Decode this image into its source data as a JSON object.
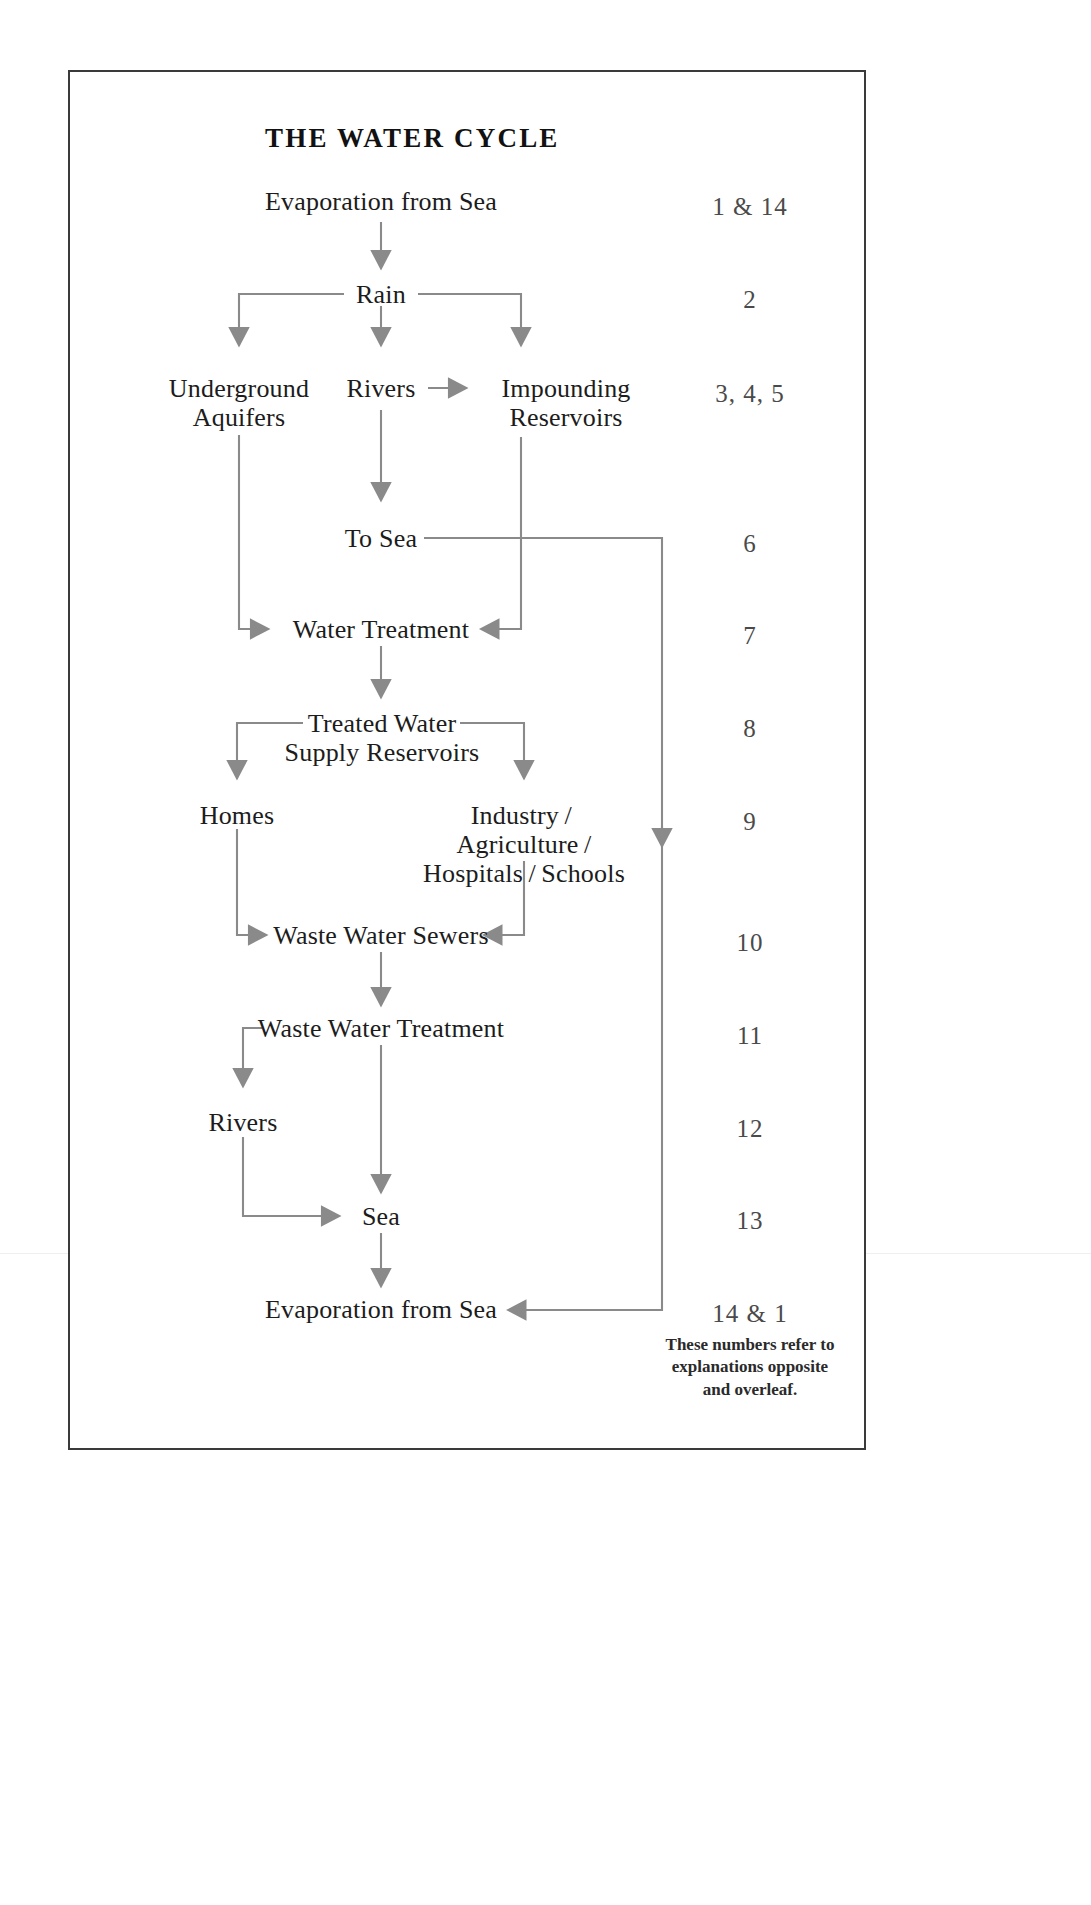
{
  "diagram": {
    "title": "THE WATER CYCLE",
    "footnote": "These numbers refer to explanations opposite and overleaf.",
    "nodes": {
      "evaporation_top": "Evaporation from Sea",
      "rain": "Rain",
      "underground_aquifers_l1": "Underground",
      "underground_aquifers_l2": "Aquifers",
      "rivers_upper": "Rivers",
      "impounding_reservoirs_l1": "Impounding",
      "impounding_reservoirs_l2": "Reservoirs",
      "to_sea": "To Sea",
      "water_treatment": "Water Treatment",
      "treated_water_l1": "Treated Water",
      "treated_water_l2": "Supply Reservoirs",
      "homes": "Homes",
      "industry_l1": "Industry / Agriculture /",
      "industry_l2": "Hospitals / Schools",
      "waste_water_sewers": "Waste Water Sewers",
      "waste_water_treatment": "Waste Water Treatment",
      "rivers_lower": "Rivers",
      "sea": "Sea",
      "evaporation_bottom": "Evaporation from Sea"
    },
    "numbers": [
      {
        "key": "n1",
        "label": "1 & 14"
      },
      {
        "key": "n2",
        "label": "2"
      },
      {
        "key": "n3",
        "label": "3, 4, 5"
      },
      {
        "key": "n4",
        "label": "6"
      },
      {
        "key": "n5",
        "label": "7"
      },
      {
        "key": "n6",
        "label": "8"
      },
      {
        "key": "n7",
        "label": "9"
      },
      {
        "key": "n8",
        "label": "10"
      },
      {
        "key": "n9",
        "label": "11"
      },
      {
        "key": "n10",
        "label": "12"
      },
      {
        "key": "n11",
        "label": "13"
      },
      {
        "key": "n12",
        "label": "14 & 1"
      }
    ],
    "colors": {
      "line": "#8a8a8a",
      "arrow": "#8a8a8a",
      "text": "#1c1c1c",
      "number": "#4a4a4a",
      "frame": "#3a3a3a",
      "background": "#ffffff"
    },
    "flow_edges": [
      {
        "from": "Evaporation from Sea",
        "to": "Rain",
        "type": "down-arrow"
      },
      {
        "from": "Rain",
        "to": "Underground Aquifers",
        "type": "branch-left-down-arrow"
      },
      {
        "from": "Rain",
        "to": "Rivers",
        "type": "down-arrow"
      },
      {
        "from": "Rain",
        "to": "Impounding Reservoirs",
        "type": "branch-right-down-arrow"
      },
      {
        "from": "Rivers",
        "to": "Impounding Reservoirs",
        "type": "right-arrow"
      },
      {
        "from": "Rivers",
        "to": "To Sea",
        "type": "down-arrow"
      },
      {
        "from": "Underground Aquifers",
        "to": "Water Treatment",
        "type": "down-right-arrow"
      },
      {
        "from": "Impounding Reservoirs",
        "to": "Water Treatment",
        "type": "down-left-arrow"
      },
      {
        "from": "To Sea",
        "to": "Evaporation from Sea",
        "type": "right-down-left-arrow"
      },
      {
        "from": "Water Treatment",
        "to": "Treated Water Supply Reservoirs",
        "type": "down-arrow"
      },
      {
        "from": "Treated Water Supply Reservoirs",
        "to": "Homes",
        "type": "branch-left-down-arrow"
      },
      {
        "from": "Treated Water Supply Reservoirs",
        "to": "Industry / Agriculture / Hospitals / Schools",
        "type": "branch-right-down-arrow"
      },
      {
        "from": "Homes",
        "to": "Waste Water Sewers",
        "type": "down-right-arrow"
      },
      {
        "from": "Industry / Agriculture / Hospitals / Schools",
        "to": "Waste Water Sewers",
        "type": "down-left-arrow"
      },
      {
        "from": "Waste Water Sewers",
        "to": "Waste Water Treatment",
        "type": "down-arrow"
      },
      {
        "from": "Waste Water Treatment",
        "to": "Rivers",
        "type": "branch-left-down-arrow"
      },
      {
        "from": "Waste Water Treatment",
        "to": "Sea",
        "type": "down-arrow"
      },
      {
        "from": "Rivers",
        "to": "Sea",
        "type": "down-right-arrow"
      },
      {
        "from": "Sea",
        "to": "Evaporation from Sea",
        "type": "down-arrow"
      }
    ]
  }
}
